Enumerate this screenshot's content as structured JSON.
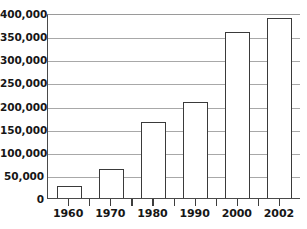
{
  "chart_data": {
    "type": "bar",
    "title": "",
    "subtitle": "",
    "xlabel": "",
    "ylabel": "",
    "categories": [
      "1960",
      "1970",
      "1980",
      "1990",
      "2000",
      "2002"
    ],
    "values": [
      27000,
      63000,
      165000,
      208000,
      360000,
      390000
    ],
    "series": [
      {
        "name": "",
        "values": [
          27000,
          63000,
          165000,
          208000,
          360000,
          390000
        ]
      }
    ],
    "ylim": [
      0,
      400000
    ],
    "y_ticks": [
      0,
      50000,
      100000,
      150000,
      200000,
      250000,
      300000,
      350000,
      400000
    ],
    "y_tick_labels": [
      "0",
      "50,000",
      "100,000",
      "150,000",
      "200,000",
      "250,000",
      "300,000",
      "350,000",
      "400,000"
    ],
    "x_tick_labels": [
      "1960",
      "1970",
      "1980",
      "1990",
      "2000",
      "2002"
    ],
    "grid": true,
    "grid_axis": "y",
    "legend": false,
    "legend_position": "none",
    "bar_fill_color": "#ffffff",
    "bar_border_color": "#3a3a3a",
    "gridline_color": "#a8a8a8",
    "axis_color": "#3d3d3d",
    "text_color": "#161616",
    "background_color": "#ffffff",
    "annotations": []
  }
}
